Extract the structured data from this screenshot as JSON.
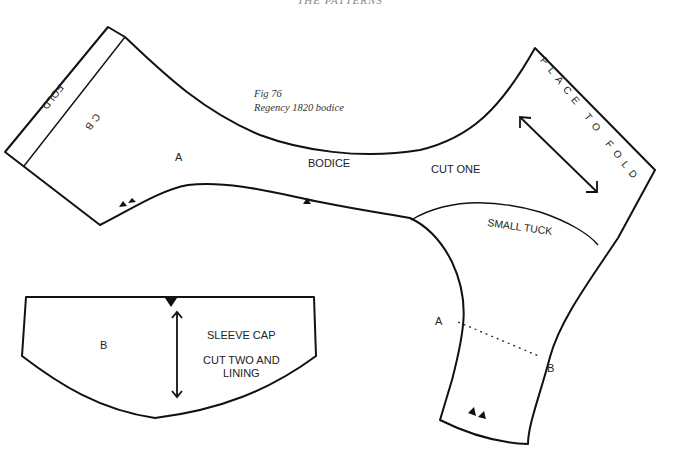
{
  "header": {
    "running_title": "THE PATTERNS"
  },
  "figure": {
    "number": "Fig 76",
    "title": "Regency 1820 bodice"
  },
  "bodice_piece": {
    "label_letter": "A",
    "name": "BODICE",
    "cut_instruction": "CUT ONE",
    "fold_left": "FOLD",
    "centre_back": "C B",
    "fold_right": "PLACE TO FOLD",
    "tuck_label": "SMALL TUCK",
    "sleeve_match_a": "A",
    "sleeve_match_b": "B",
    "notch_count_left": 2,
    "notch_count_middle": 1,
    "notch_count_sleeve": 2
  },
  "sleeve_cap_piece": {
    "label_letter": "B",
    "name": "SLEEVE CAP",
    "cut_instruction_line1": "CUT TWO AND",
    "cut_instruction_line2": "LINING",
    "notch_count_top": 1
  },
  "colors": {
    "line": "#111111",
    "text": "#222222",
    "background": "#ffffff"
  }
}
